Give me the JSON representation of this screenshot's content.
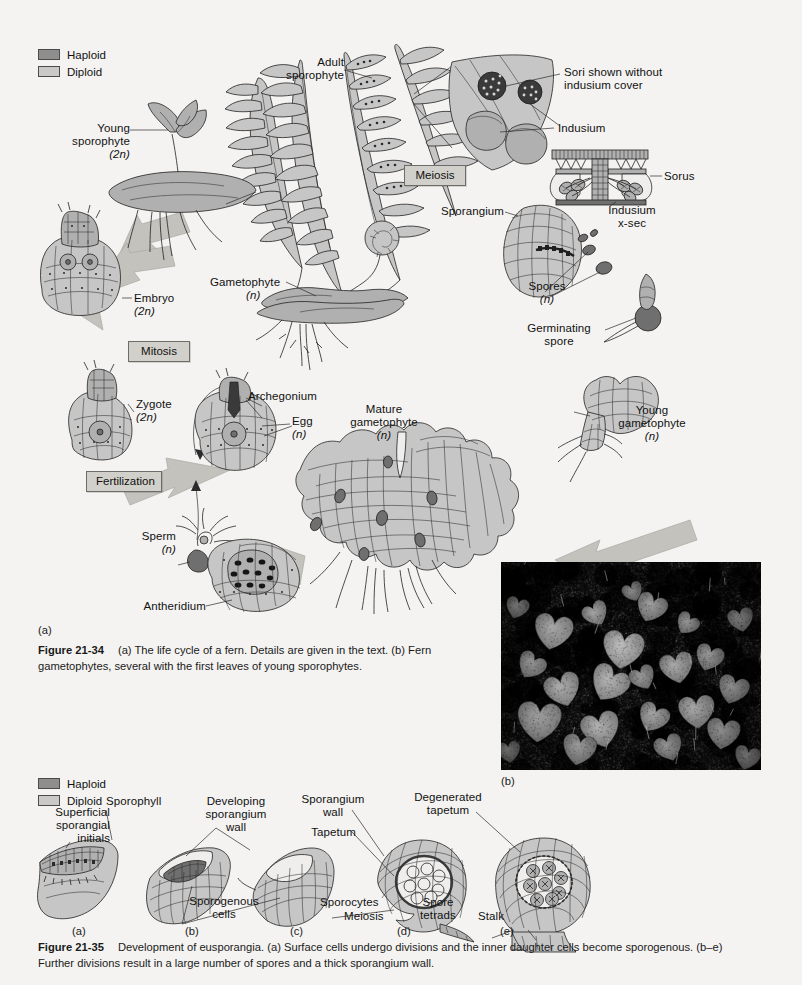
{
  "page": {
    "background": "#f4f3f1",
    "width": 802,
    "height": 985
  },
  "colors": {
    "haploid": "#8e8e8e",
    "diploid": "#c9c9c9",
    "process_box": "#d2d0cb",
    "ink": "#1a1a1a"
  },
  "figure_21_34": {
    "legend": {
      "haploid_label": "Haploid",
      "diploid_label": "Diploid"
    },
    "process_boxes": {
      "meiosis": "Meiosis",
      "mitosis": "Mitosis",
      "fertilization": "Fertilization"
    },
    "labels": {
      "young_sporophyte": "Young\nsporophyte",
      "young_sporophyte_ploidy": "(2n)",
      "adult_sporophyte": "Adult\nsporophyte",
      "sori_without_indusium": "Sori shown without\nindusium cover",
      "indusium": "Indusium",
      "sorus": "Sorus",
      "indusium_xsec": "Indusium\nx-sec",
      "sporangium": "Sporangium",
      "spores": "Spores",
      "spores_ploidy": "(n)",
      "germinating_spore": "Germinating\nspore",
      "gametophyte": "Gametophyte",
      "gametophyte_ploidy": "(n)",
      "embryo": "Embryo",
      "embryo_ploidy": "(2n)",
      "zygote": "Zygote",
      "zygote_ploidy": "(2n)",
      "archegonium": "Archegonium",
      "egg": "Egg",
      "egg_ploidy": "(n)",
      "mature_gametophyte": "Mature\ngametophyte",
      "mature_gametophyte_ploidy": "(n)",
      "young_gametophyte": "Young\ngametophyte",
      "young_gametophyte_ploidy": "(n)",
      "sperm": "Sperm",
      "sperm_ploidy": "(n)",
      "antheridium": "Antheridium"
    },
    "panel_letters": {
      "a": "(a)",
      "b": "(b)"
    },
    "caption": {
      "figure_number": "Figure 21-34",
      "text": "(a) The life cycle of a fern. Details are given in the text. (b) Fern gametophytes, several with the first leaves of young sporophytes."
    }
  },
  "figure_21_35": {
    "legend": {
      "haploid_label": "Haploid",
      "diploid_label": "Diploid"
    },
    "labels": {
      "superficial_sporangial_initials": "Superficial\nsporangial\ninitials",
      "sporophyll": "Sporophyll",
      "developing_sporangium_wall": "Developing\nsporangium\nwall",
      "sporogenous_cells": "Sporogenous\ncells",
      "sporangium_wall": "Sporangium\nwall",
      "tapetum": "Tapetum",
      "sporocytes": "Sporocytes",
      "meiosis": "Meiosis",
      "degenerated_tapetum": "Degenerated\ntapetum",
      "spore_tetrads": "Spore\ntetrads",
      "stalk": "Stalk"
    },
    "panel_letters": [
      "(a)",
      "(b)",
      "(c)",
      "(d)",
      "(e)"
    ],
    "caption": {
      "figure_number": "Figure 21-35",
      "text": "Development of eusporangia. (a) Surface cells undergo divisions and the inner daughter cells become sporogenous. (b–e) Further divisions result in a large number of spores and a thick sporangium wall."
    }
  }
}
